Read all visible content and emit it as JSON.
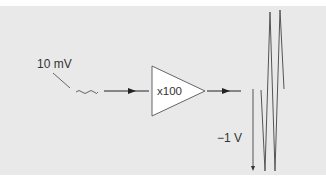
{
  "diagram": {
    "title": "",
    "input": {
      "label": "10 mV",
      "signal": "small sine wave"
    },
    "amplifier": {
      "label": "x100",
      "shape": "triangle"
    },
    "output": {
      "label": "−1 V",
      "signal": "large sine wave"
    },
    "colors": {
      "background": "#e9e9e9",
      "stroke": "#333333",
      "amp_fill": "#ffffff"
    }
  }
}
